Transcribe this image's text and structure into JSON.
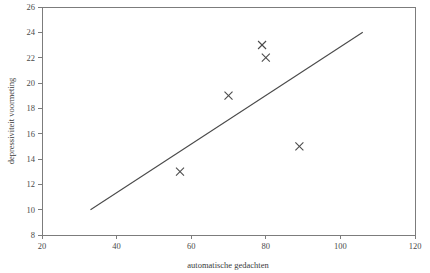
{
  "chart_data": {
    "type": "scatter",
    "title": "",
    "xlabel": "automatische gedachten",
    "ylabel": "depressiviteit voormeting",
    "xlim": [
      20,
      120
    ],
    "ylim": [
      8,
      26
    ],
    "xticks": [
      20,
      40,
      60,
      80,
      100,
      120
    ],
    "yticks": [
      8,
      10,
      12,
      14,
      16,
      18,
      20,
      22,
      24,
      26
    ],
    "xtick_labels": [
      "20",
      "40",
      "60",
      "80",
      "100",
      "120"
    ],
    "ytick_labels": [
      "8",
      "10",
      "12",
      "14",
      "16",
      "18",
      "20",
      "22",
      "24",
      "26"
    ],
    "grid": false,
    "legend": null,
    "marker": "x",
    "points": [
      {
        "x": 57,
        "y": 13
      },
      {
        "x": 70,
        "y": 19
      },
      {
        "x": 79,
        "y": 23
      },
      {
        "x": 80,
        "y": 22
      },
      {
        "x": 89,
        "y": 15
      }
    ],
    "series": [
      {
        "name": "observaties",
        "type": "scatter",
        "x": [
          57,
          70,
          79,
          80,
          89
        ],
        "values": [
          13,
          19,
          23,
          22,
          15
        ]
      },
      {
        "name": "regressielijn",
        "type": "line",
        "x": [
          33,
          106
        ],
        "values": [
          10,
          24
        ]
      }
    ],
    "trend_line": {
      "x_start": 33,
      "y_start": 10,
      "x_end": 106,
      "y_end": 24
    },
    "colors": {
      "axis": "#7c7c7c",
      "marker": "#4a4a4a",
      "line": "#4a4a4a",
      "text": "#3b3b3b",
      "background": "#ffffff"
    }
  }
}
